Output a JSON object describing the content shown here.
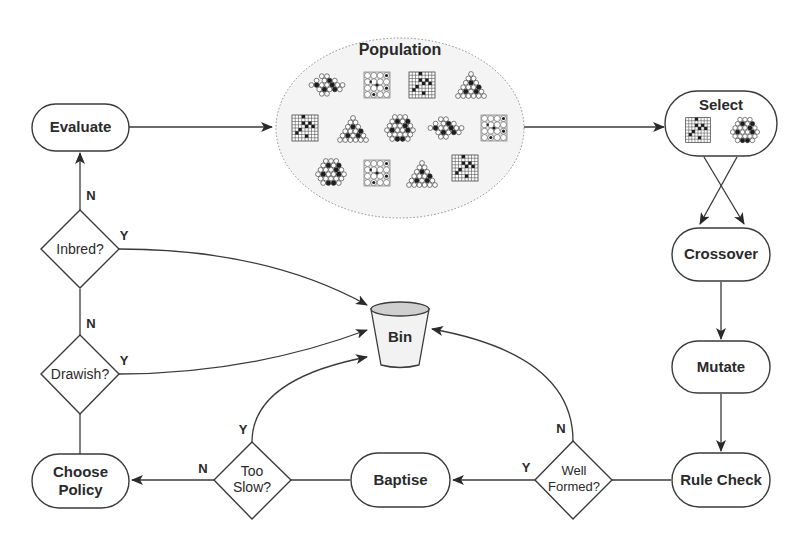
{
  "diagram": {
    "type": "flowchart",
    "nodes": {
      "evaluate": {
        "label": "Evaluate",
        "shape": "pill"
      },
      "population": {
        "label": "Population",
        "shape": "ellipse",
        "boards": [
          "hex-diamond",
          "square-go",
          "square-grid",
          "triangle",
          "square-grid",
          "triangle",
          "hexagon",
          "hex-diamond",
          "square-go",
          "hexagon",
          "square-go",
          "triangle",
          "square-grid"
        ]
      },
      "select": {
        "label": "Select",
        "shape": "pill",
        "boards": [
          "square-grid",
          "hexagon"
        ]
      },
      "crossover": {
        "label": "Crossover",
        "shape": "pill"
      },
      "mutate": {
        "label": "Mutate",
        "shape": "pill"
      },
      "rule_check": {
        "label": "Rule Check",
        "shape": "pill"
      },
      "well_formed": {
        "line1": "Well",
        "line2": "Formed?",
        "shape": "diamond"
      },
      "baptise": {
        "label": "Baptise",
        "shape": "pill"
      },
      "too_slow": {
        "line1": "Too",
        "line2": "Slow?",
        "shape": "diamond"
      },
      "choose_policy": {
        "line1": "Choose",
        "line2": "Policy",
        "shape": "pill"
      },
      "drawish": {
        "label": "Drawish?",
        "shape": "diamond"
      },
      "inbred": {
        "label": "Inbred?",
        "shape": "diamond"
      },
      "bin": {
        "label": "Bin",
        "shape": "bucket"
      }
    },
    "edge_labels": {
      "inbred_no": "N",
      "inbred_yes": "Y",
      "drawish_no": "N",
      "drawish_yes": "Y",
      "too_slow_yes": "Y",
      "too_slow_no": "N",
      "well_formed_no": "N",
      "well_formed_yes": "Y"
    },
    "edges": [
      {
        "from": "evaluate",
        "to": "population"
      },
      {
        "from": "population",
        "to": "select"
      },
      {
        "from": "select",
        "to": "crossover",
        "note": "two crossing arrows"
      },
      {
        "from": "crossover",
        "to": "mutate"
      },
      {
        "from": "mutate",
        "to": "rule_check"
      },
      {
        "from": "rule_check",
        "to": "well_formed"
      },
      {
        "from": "well_formed",
        "to": "baptise",
        "label": "Y"
      },
      {
        "from": "well_formed",
        "to": "bin",
        "label": "N"
      },
      {
        "from": "baptise",
        "to": "too_slow"
      },
      {
        "from": "too_slow",
        "to": "choose_policy",
        "label": "N"
      },
      {
        "from": "too_slow",
        "to": "bin",
        "label": "Y"
      },
      {
        "from": "choose_policy",
        "to": "drawish"
      },
      {
        "from": "drawish",
        "to": "inbred",
        "label": "N"
      },
      {
        "from": "drawish",
        "to": "bin",
        "label": "Y"
      },
      {
        "from": "inbred",
        "to": "evaluate",
        "label": "N"
      },
      {
        "from": "inbred",
        "to": "bin",
        "label": "Y"
      }
    ]
  }
}
